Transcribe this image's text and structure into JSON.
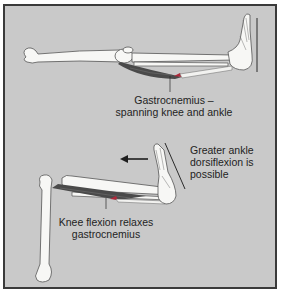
{
  "diagram": {
    "colors": {
      "background": "#c9c9c9",
      "frame": "#3a3a3a",
      "bone_fill": "#f7f7f5",
      "bone_outline": "#555555",
      "muscle": "#4a4a4a",
      "muscle_red": "#b0283a",
      "line": "#2a2a2a"
    },
    "top_panel": {
      "label_line1": "Gastrocnemius –",
      "label_line2": "spanning knee and ankle"
    },
    "bottom_panel": {
      "ankle_label_line1": "Greater ankle",
      "ankle_label_line2": "dorsiflexion is",
      "ankle_label_line3": "possible",
      "knee_label_line1": "Knee flexion relaxes",
      "knee_label_line2": "gastrocnemius",
      "arrow_direction": "left"
    }
  }
}
